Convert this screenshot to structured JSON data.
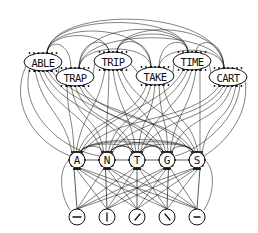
{
  "diagram": {
    "type": "interactive-activation-network",
    "colors": {
      "stroke": "#111111",
      "background": "#ffffff"
    },
    "word_level": {
      "nodes": [
        {
          "id": "ABLE",
          "label": "ABLE",
          "cx": 43,
          "cy": 62,
          "rx": 19,
          "ry": 9
        },
        {
          "id": "TRAP",
          "label": "TRAP",
          "cx": 75,
          "cy": 77,
          "rx": 19,
          "ry": 9
        },
        {
          "id": "TRIP",
          "label": "TRIP",
          "cx": 113,
          "cy": 61,
          "rx": 19,
          "ry": 9
        },
        {
          "id": "TAKE",
          "label": "TAKE",
          "cx": 155,
          "cy": 76,
          "rx": 19,
          "ry": 9
        },
        {
          "id": "TIME",
          "label": "TIME",
          "cx": 192,
          "cy": 61,
          "rx": 19,
          "ry": 9
        },
        {
          "id": "CART",
          "label": "CART",
          "cx": 228,
          "cy": 77,
          "rx": 19,
          "ry": 9
        }
      ]
    },
    "letter_level": {
      "nodes": [
        {
          "id": "A",
          "label": "A",
          "cx": 77,
          "cy": 160,
          "r": 8
        },
        {
          "id": "N",
          "label": "N",
          "cx": 107,
          "cy": 160,
          "r": 8
        },
        {
          "id": "T",
          "label": "T",
          "cx": 137,
          "cy": 160,
          "r": 8
        },
        {
          "id": "G",
          "label": "G",
          "cx": 167,
          "cy": 160,
          "r": 8
        },
        {
          "id": "S",
          "label": "S",
          "cx": 197,
          "cy": 160,
          "r": 8
        }
      ]
    },
    "feature_level": {
      "nodes": [
        {
          "id": "f1",
          "glyph": "horizontal-stroke",
          "cx": 77,
          "cy": 217,
          "r": 8
        },
        {
          "id": "f2",
          "glyph": "vertical-stroke",
          "cx": 107,
          "cy": 217,
          "r": 8
        },
        {
          "id": "f3",
          "glyph": "forward-diagonal-stroke",
          "cx": 137,
          "cy": 217,
          "r": 8
        },
        {
          "id": "f4",
          "glyph": "back-diagonal-stroke",
          "cx": 167,
          "cy": 217,
          "r": 8
        },
        {
          "id": "f5",
          "glyph": "short-horizontal-stroke",
          "cx": 197,
          "cy": 217,
          "r": 8
        }
      ]
    },
    "connections": {
      "word_to_word": "all-pairs arcs (inhibitory, drawn above)",
      "word_to_letter": "dense bidirectional arcs",
      "letter_to_letter": "adjacent arcs",
      "feature_to_letter": "all-to-all straight arrows"
    }
  }
}
